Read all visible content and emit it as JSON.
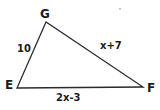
{
  "diagram": {
    "type": "triangle",
    "vertices": [
      {
        "label": "G",
        "position": "top"
      },
      {
        "label": "E",
        "position": "bottom-left"
      },
      {
        "label": "F",
        "position": "bottom-right"
      }
    ],
    "sides": [
      {
        "from": "E",
        "to": "G",
        "label": "10"
      },
      {
        "from": "G",
        "to": "F",
        "label": "x+7"
      },
      {
        "from": "E",
        "to": "F",
        "label": "2x-3"
      }
    ],
    "colors": {
      "line": "#2b2b2b",
      "text": "#1c1c1c",
      "background": "#ffffff",
      "artifact_dot": "#9a9a9a"
    }
  }
}
